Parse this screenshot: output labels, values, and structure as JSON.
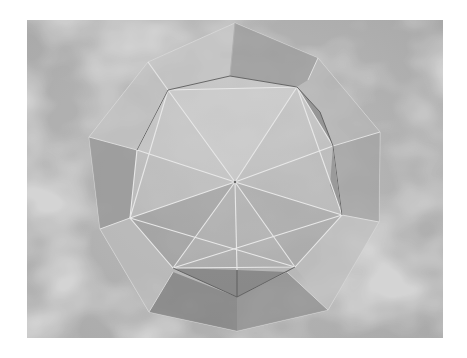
{
  "image": {
    "subject": "translucent polyhedron render: icosahedron wireframe inside a dodecahedron-like shell",
    "background": "grey cloudy texture",
    "frame": {
      "x": 27,
      "y": 20,
      "width": 416,
      "height": 318
    },
    "colors": {
      "margin": "#ffffff",
      "background_base": "#a8a8a8",
      "background_light": "#d2d2d2",
      "background_dark": "#8a8a8a",
      "face_light": "#c4c4c4",
      "face_mid": "#a2a2a2",
      "face_dark": "#7e7e7e",
      "edge_light": "#e6e6e6",
      "edge_dark": "#5a5a5a"
    }
  }
}
